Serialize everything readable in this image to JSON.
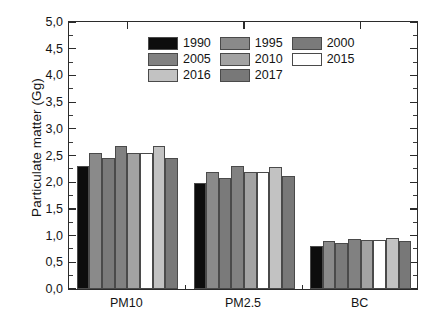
{
  "chart_data": {
    "type": "bar",
    "title": "",
    "subtitle": "",
    "xlabel": "",
    "ylabel": "Particulate matter (Gg)",
    "categories": [
      "PM10",
      "PM2.5",
      "BC"
    ],
    "ylim": [
      0.0,
      5.0
    ],
    "y_ticks": [
      "0,0",
      "0,5",
      "1,0",
      "1,5",
      "2,0",
      "2,5",
      "3,0",
      "3,5",
      "4,0",
      "4,5",
      "5,0"
    ],
    "y_tick_values": [
      0.0,
      0.5,
      1.0,
      1.5,
      2.0,
      2.5,
      3.0,
      3.5,
      4.0,
      4.5,
      5.0
    ],
    "y_minor_ticks_between": 1,
    "grid": false,
    "legend_position": "upper center",
    "decimal_separator": ",",
    "series": [
      {
        "name": "1990",
        "color": "#0d0d0d",
        "values": [
          2.31,
          1.99,
          0.81
        ]
      },
      {
        "name": "1995",
        "color": "#8a8a8a",
        "values": [
          2.55,
          2.19,
          0.89
        ]
      },
      {
        "name": "2000",
        "color": "#7a7a7a",
        "values": [
          2.45,
          2.08,
          0.86
        ]
      },
      {
        "name": "2005",
        "color": "#818181",
        "values": [
          2.68,
          2.31,
          0.94
        ]
      },
      {
        "name": "2010",
        "color": "#a3a3a3",
        "values": [
          2.55,
          2.19,
          0.91
        ]
      },
      {
        "name": "2015",
        "color": "#ffffff",
        "values": [
          2.55,
          2.19,
          0.91
        ]
      },
      {
        "name": "2016",
        "color": "#c2c2c2",
        "values": [
          2.67,
          2.29,
          0.95
        ]
      },
      {
        "name": "2017",
        "color": "#787878",
        "values": [
          2.46,
          2.11,
          0.89
        ]
      }
    ]
  },
  "axes": {
    "y_title": "Particulate matter (Gg)"
  },
  "legend": {
    "entries": [
      {
        "label": "1990"
      },
      {
        "label": "1995"
      },
      {
        "label": "2000"
      },
      {
        "label": "2005"
      },
      {
        "label": "2010"
      },
      {
        "label": "2015"
      },
      {
        "label": "2016"
      },
      {
        "label": "2017"
      }
    ]
  }
}
